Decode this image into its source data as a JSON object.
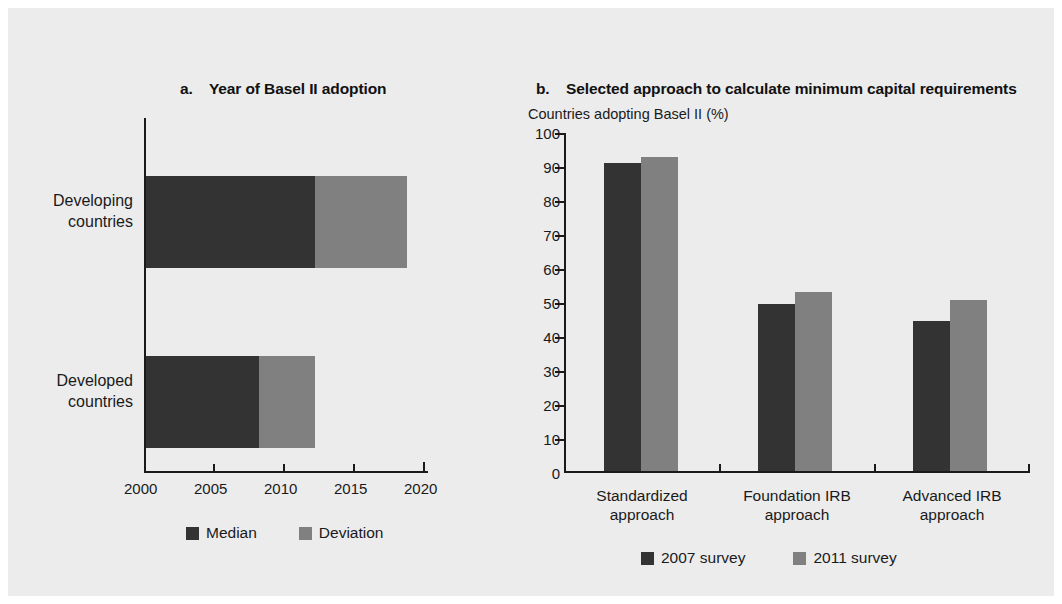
{
  "figure": {
    "background_color": "#ececed",
    "colors": {
      "dark": "#333333",
      "light": "#808080",
      "axis": "#1a1a1a",
      "text": "#1a1a1a"
    }
  },
  "panel_a": {
    "label": "a.",
    "title": "Year of Basel II adoption",
    "legend": [
      {
        "label": "Median",
        "color": "#333333"
      },
      {
        "label": "Deviation",
        "color": "#808080"
      }
    ]
  },
  "panel_b": {
    "label": "b.",
    "title": "Selected approach to calculate minimum capital requirements",
    "axis_unit": "Countries adopting Basel II (%)",
    "legend": [
      {
        "label": "2007 survey",
        "color": "#333333"
      },
      {
        "label": "2011 survey",
        "color": "#808080"
      }
    ]
  },
  "chart_data": [
    {
      "type": "bar",
      "orientation": "horizontal",
      "stacked": true,
      "title": "a. Year of Basel II adoption",
      "xlabel": "",
      "ylabel": "",
      "xlim": [
        2000,
        2020
      ],
      "xticks": [
        2000,
        2005,
        2010,
        2015,
        2020
      ],
      "ticklabels": [
        "2000",
        "2005",
        "2010",
        "2015",
        "2020"
      ],
      "grid": false,
      "legend_position": "bottom",
      "categories": [
        "Developing countries",
        "Developed countries"
      ],
      "category_lines": [
        [
          "Developing",
          "countries"
        ],
        [
          "Developed",
          "countries"
        ]
      ],
      "series": [
        {
          "name": "Median",
          "color": "#333333",
          "values": [
            2012,
            2008
          ]
        },
        {
          "name": "Deviation",
          "color": "#808080",
          "values": [
            2018.5,
            2012
          ]
        }
      ],
      "notes": "Bars start at 2000; dark segment ends at the median year, light segment extends to the median plus deviation."
    },
    {
      "type": "bar",
      "orientation": "vertical",
      "stacked": false,
      "title": "b. Selected approach to calculate minimum capital requirements",
      "xlabel": "",
      "ylabel": "Countries adopting Basel II (%)",
      "ylim": [
        0,
        100
      ],
      "yticks": [
        0,
        10,
        20,
        30,
        40,
        50,
        60,
        70,
        80,
        90,
        100
      ],
      "yticklabels": [
        "0",
        "10",
        "20",
        "30",
        "40",
        "50",
        "60",
        "70",
        "80",
        "90",
        "100"
      ],
      "grid": false,
      "legend_position": "bottom",
      "categories": [
        "Standardized approach",
        "Foundation IRB approach",
        "Advanced IRB approach"
      ],
      "category_lines": [
        [
          "Standardized",
          "approach"
        ],
        [
          "Foundation IRB",
          "approach"
        ],
        [
          "Advanced IRB",
          "approach"
        ]
      ],
      "series": [
        {
          "name": "2007 survey",
          "color": "#333333",
          "values": [
            91,
            49.5,
            44.5
          ]
        },
        {
          "name": "2011 survey",
          "color": "#808080",
          "values": [
            93,
            53,
            50.5
          ]
        }
      ]
    }
  ]
}
